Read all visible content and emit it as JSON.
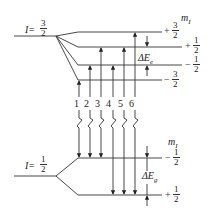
{
  "diagram": {
    "upper_state": {
      "label_prefix": "I=",
      "spin_num": "3",
      "spin_den": "2",
      "m_label": "m",
      "m_sub": "I",
      "splitting_label": "ΔE",
      "splitting_sub": "e",
      "levels": [
        {
          "sign": "+",
          "num": "3",
          "den": "2"
        },
        {
          "sign": "+",
          "num": "1",
          "den": "2"
        },
        {
          "sign": "−",
          "num": "1",
          "den": "2"
        },
        {
          "sign": "−",
          "num": "3",
          "den": "2"
        }
      ]
    },
    "lower_state": {
      "label_prefix": "I=",
      "spin_num": "1",
      "spin_den": "2",
      "m_label": "m",
      "m_sub": "I",
      "splitting_label": "ΔE",
      "splitting_sub": "g",
      "levels": [
        {
          "sign": "−",
          "num": "1",
          "den": "2"
        },
        {
          "sign": "+",
          "num": "1",
          "den": "2"
        }
      ]
    },
    "transitions": [
      {
        "label": "1",
        "from": "-1/2",
        "to": "-3/2"
      },
      {
        "label": "2",
        "from": "-1/2",
        "to": "-1/2"
      },
      {
        "label": "3",
        "from": "-1/2",
        "to": "+1/2"
      },
      {
        "label": "4",
        "from": "+1/2",
        "to": "-1/2"
      },
      {
        "label": "5",
        "from": "+1/2",
        "to": "+1/2"
      },
      {
        "label": "6",
        "from": "+1/2",
        "to": "+3/2"
      }
    ]
  }
}
